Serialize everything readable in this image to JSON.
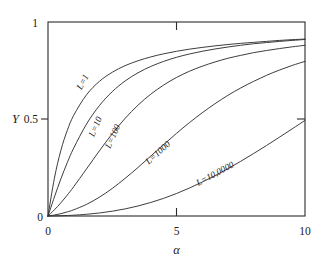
{
  "chart_data": {
    "type": "line",
    "title": "",
    "subtitle": "",
    "xlabel": "α",
    "ylabel": "Y",
    "xlim": [
      0,
      10
    ],
    "ylim": [
      0,
      1
    ],
    "grid": false,
    "legend_position": "inline-curve-labels",
    "xticks": [
      {
        "value": 0,
        "label": "0"
      },
      {
        "value": 5,
        "label": "5"
      },
      {
        "value": 10,
        "label": "10"
      }
    ],
    "yticks": [
      {
        "value": 0,
        "label": "0"
      },
      {
        "value": 0.5,
        "label": "0.5"
      },
      {
        "value": 1,
        "label": "1"
      }
    ],
    "x": [
      0,
      0.25,
      0.5,
      0.75,
      1,
      1.5,
      2,
      2.5,
      3,
      3.5,
      4,
      4.5,
      5,
      5.5,
      6,
      6.5,
      7,
      7.5,
      8,
      8.5,
      9,
      9.5,
      10
    ],
    "series": [
      {
        "name": "L=1",
        "label": "L=1",
        "color": "#333333",
        "values": [
          0,
          0.195,
          0.338,
          0.441,
          0.519,
          0.625,
          0.694,
          0.741,
          0.775,
          0.8,
          0.82,
          0.836,
          0.849,
          0.86,
          0.869,
          0.877,
          0.884,
          0.89,
          0.895,
          0.9,
          0.905,
          0.909,
          0.912
        ]
      },
      {
        "name": "L=10",
        "label": "L=10",
        "color": "#333333",
        "values": [
          0,
          0.098,
          0.191,
          0.275,
          0.35,
          0.474,
          0.569,
          0.641,
          0.696,
          0.738,
          0.771,
          0.797,
          0.818,
          0.835,
          0.849,
          0.861,
          0.871,
          0.88,
          0.888,
          0.894,
          0.9,
          0.905,
          0.91
        ]
      },
      {
        "name": "L=100",
        "label": "L=100",
        "color": "#333333",
        "values": [
          0,
          0.032,
          0.068,
          0.108,
          0.151,
          0.243,
          0.336,
          0.424,
          0.503,
          0.571,
          0.628,
          0.675,
          0.714,
          0.746,
          0.772,
          0.794,
          0.813,
          0.828,
          0.842,
          0.853,
          0.863,
          0.872,
          0.88
        ]
      },
      {
        "name": "L=1000",
        "label": "L=1000",
        "color": "#333333",
        "values": [
          0,
          0.005,
          0.012,
          0.021,
          0.032,
          0.06,
          0.097,
          0.142,
          0.194,
          0.25,
          0.309,
          0.368,
          0.426,
          0.481,
          0.532,
          0.579,
          0.622,
          0.66,
          0.694,
          0.725,
          0.752,
          0.776,
          0.797
        ]
      },
      {
        "name": "L=10,0000",
        "label": "L=10,0000",
        "color": "#333333",
        "values": [
          0,
          0.0006,
          0.0014,
          0.0026,
          0.0042,
          0.0088,
          0.0155,
          0.0247,
          0.0366,
          0.0515,
          0.0697,
          0.0911,
          0.116,
          0.144,
          0.175,
          0.208,
          0.244,
          0.282,
          0.322,
          0.363,
          0.406,
          0.449,
          0.493
        ]
      }
    ],
    "curve_label_positions": [
      {
        "name": "L=1",
        "x": 1.45,
        "y": 0.685,
        "rotate": -62
      },
      {
        "name": "L=10",
        "x": 1.95,
        "y": 0.455,
        "rotate": -67
      },
      {
        "name": "L=100",
        "x": 2.62,
        "y": 0.405,
        "rotate": -66
      },
      {
        "name": "L=1000",
        "x": 4.35,
        "y": 0.315,
        "rotate": -42
      },
      {
        "name": "L=10,0000",
        "x": 6.55,
        "y": 0.205,
        "rotate": -28
      }
    ]
  }
}
